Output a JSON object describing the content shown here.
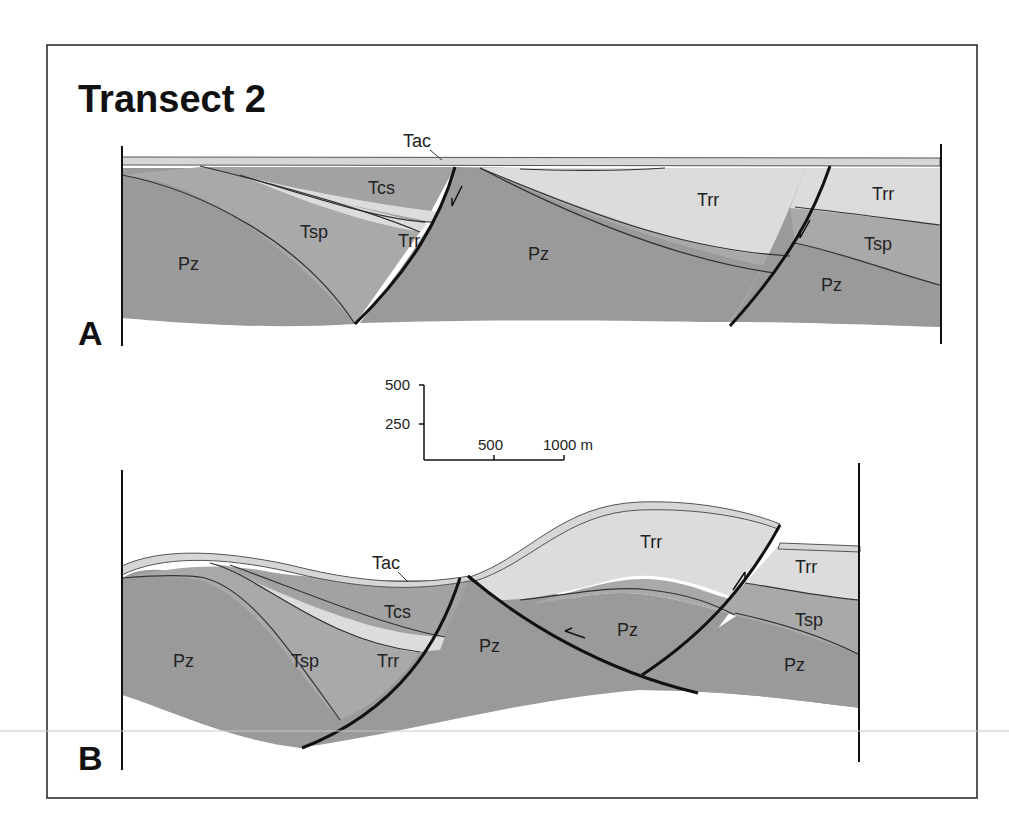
{
  "figure": {
    "title": "Transect 2",
    "frame_color": "#222222",
    "colors": {
      "Pz": "#9a9a9a",
      "Tsp": "#a9a9a9",
      "Tcs": "#a2a2a2",
      "Trr": "#dcdcdc",
      "Tac": "#d6d6d6"
    }
  },
  "panel_a": {
    "label": "A",
    "units": {
      "tac": "Tac",
      "tcs": "Tcs",
      "tsp_left": "Tsp",
      "trr_left": "Trr",
      "pz_left": "Pz",
      "pz_center": "Pz",
      "trr_center": "Trr",
      "trr_right": "Trr",
      "tsp_right": "Tsp",
      "pz_right": "Pz"
    },
    "fault_arrows": [
      "normal-down",
      "normal-down"
    ]
  },
  "scale_bar": {
    "vertical_ticks": [
      "500",
      "250"
    ],
    "horizontal_ticks": [
      "500",
      "1000 m"
    ]
  },
  "panel_b": {
    "label": "B",
    "units": {
      "tac": "Tac",
      "tcs": "Tcs",
      "tsp_left": "Tsp",
      "trr_left": "Trr",
      "pz_left": "Pz",
      "pz_center": "Pz",
      "pz_block": "Pz",
      "trr_top": "Trr",
      "trr_right": "Trr",
      "tsp_right": "Tsp",
      "pz_right": "Pz"
    },
    "fault_arrows": [
      "thrust-left",
      "reverse-up"
    ]
  }
}
